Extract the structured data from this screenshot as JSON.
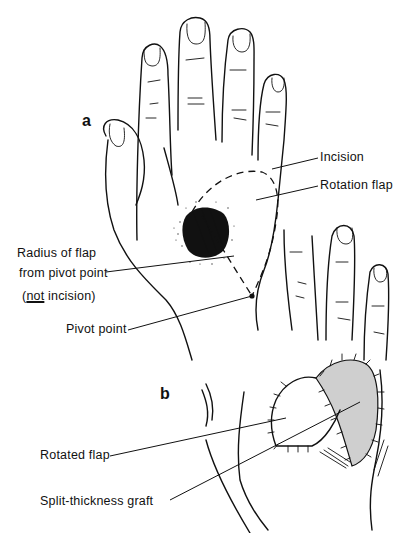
{
  "figure": {
    "panels": [
      {
        "id": "a",
        "label": "a"
      },
      {
        "id": "b",
        "label": "b"
      }
    ],
    "labels": {
      "incision": "Incision",
      "rotation_flap": "Rotation flap",
      "radius_line1": "Radius of flap",
      "radius_line2": "from pivot point",
      "not_incision_open": "(",
      "not_incision_not": "not",
      "not_incision_rest": " incision)",
      "pivot_point": "Pivot point",
      "rotated_flap": "Rotated flap",
      "split_thickness_graft": "Split-thickness graft"
    },
    "colors": {
      "ink": "#111111",
      "background": "#ffffff"
    }
  }
}
